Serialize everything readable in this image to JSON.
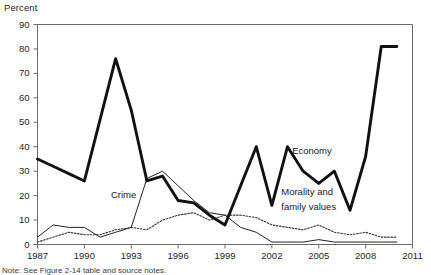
{
  "chart_data": {
    "type": "line",
    "title": "",
    "subtitle": "",
    "ylabel": "Percent",
    "xlabel": "",
    "ylim": [
      0,
      90
    ],
    "xlim": [
      1987,
      2011
    ],
    "grid": false,
    "legend_position": "inline-annotations",
    "y_ticks": [
      0,
      10,
      20,
      30,
      40,
      50,
      60,
      70,
      80,
      90
    ],
    "y_tick_labels": [
      "0",
      "10",
      "20",
      "30",
      "40",
      "50",
      "60",
      "70",
      "80",
      "90"
    ],
    "x_ticks": [
      1987,
      1990,
      1993,
      1996,
      1999,
      2002,
      2005,
      2008,
      2011
    ],
    "x_tick_labels": [
      "1987",
      "1990",
      "1993",
      "1996",
      "1999",
      "2002",
      "2005",
      "2008",
      "2011"
    ],
    "x": [
      1987,
      1988,
      1989,
      1990,
      1991,
      1992,
      1993,
      1994,
      1995,
      1996,
      1997,
      1998,
      1999,
      2000,
      2001,
      2002,
      2003,
      2004,
      2005,
      2006,
      2007,
      2008,
      2009,
      2010
    ],
    "series": [
      {
        "name": "Economy",
        "style": "thick-solid",
        "color": "#111111",
        "values": [
          35,
          32,
          29,
          26,
          51,
          76,
          55,
          26,
          28,
          18,
          17,
          12,
          8,
          24,
          40,
          16,
          40,
          30,
          25,
          30,
          14,
          36,
          81,
          81
        ]
      },
      {
        "name": "Crime",
        "style": "thin-solid",
        "color": "#222222",
        "values": [
          3,
          8,
          7,
          7,
          3,
          5,
          7,
          27,
          30,
          24,
          18,
          13,
          12,
          7,
          5,
          1,
          1,
          1,
          2,
          1,
          1,
          1,
          1,
          1
        ]
      },
      {
        "name": "Morality and family values",
        "style": "dotted",
        "color": "#333333",
        "values": [
          1,
          3,
          5,
          4,
          4,
          6,
          7,
          6,
          10,
          12,
          13,
          10,
          12,
          12,
          11,
          8,
          7,
          6,
          8,
          5,
          4,
          5,
          3,
          3
        ]
      }
    ],
    "annotations": [
      {
        "text": "Crime",
        "x": 1991.7,
        "y": 20
      },
      {
        "text": "Economy",
        "x": 2003.3,
        "y": 38
      },
      {
        "text": "Morality and",
        "x": 2002.6,
        "y": 21
      },
      {
        "text": "family values",
        "x": 2002.6,
        "y": 15
      }
    ]
  },
  "note": "Note: See Figure 2-14 table and source notes."
}
